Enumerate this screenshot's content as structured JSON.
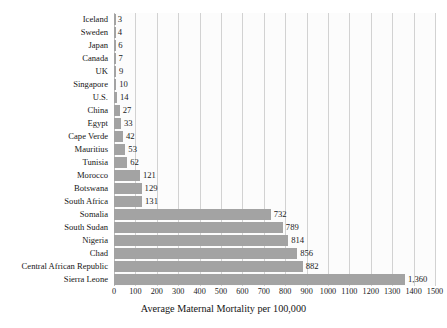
{
  "chart_data": {
    "type": "bar",
    "orientation": "horizontal",
    "title": "",
    "xlabel": "Average Maternal Mortality per 100,000",
    "ylabel": "",
    "xlim": [
      0,
      1500
    ],
    "grid": true,
    "legend": null,
    "bar_color": "#a3a3a3",
    "gridline_color": "#d2d2d2",
    "background_color": "#fcfcfc",
    "xticks": [
      0,
      100,
      200,
      300,
      400,
      500,
      600,
      700,
      800,
      900,
      1000,
      1100,
      1200,
      1300,
      1400,
      1500
    ],
    "xtick_labels": [
      "0",
      "100",
      "200",
      "300",
      "400",
      "500",
      "600",
      "700",
      "800",
      "900",
      "1000",
      "1100",
      "1200",
      "1300",
      "1400",
      "1500"
    ],
    "categories": [
      "Iceland",
      "Sweden",
      "Japan",
      "Canada",
      "UK",
      "Singapore",
      "U.S.",
      "China",
      "Egypt",
      "Cape Verde",
      "Mauritius",
      "Tunisia",
      "Morocco",
      "Botswana",
      "South Africa",
      "Somalia",
      "South Sudan",
      "Nigeria",
      "Chad",
      "Central African Republic",
      "Sierra Leone"
    ],
    "values": [
      3,
      4,
      6,
      7,
      9,
      10,
      14,
      27,
      33,
      42,
      53,
      62,
      121,
      129,
      131,
      732,
      789,
      814,
      856,
      882,
      1360
    ],
    "value_labels": [
      "3",
      "4",
      "6",
      "7",
      "9",
      "10",
      "14",
      "27",
      "33",
      "42",
      "53",
      "62",
      "121",
      "129",
      "131",
      "732",
      "789",
      "814",
      "856",
      "882",
      "1,360"
    ]
  }
}
